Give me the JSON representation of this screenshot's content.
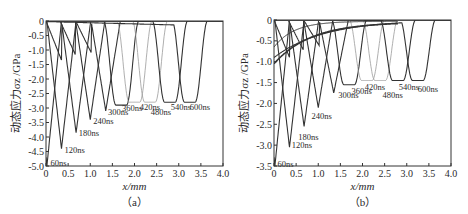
{
  "chart_data": [
    {
      "panel": "(a)",
      "type": "line",
      "caption": "（a）",
      "title": "",
      "xlabel": "x/mm",
      "ylabel": "动态应力σz /GPa",
      "xlim": [
        0,
        4.0
      ],
      "ylim": [
        -5.0,
        0
      ],
      "xticks": [
        "0",
        "0.5",
        "1.0",
        "1.5",
        "2.0",
        "2.5",
        "3.0",
        "3.5",
        "4.0"
      ],
      "yticks": [
        "0",
        "-0.5",
        "-1.0",
        "-1.5",
        "-2.0",
        "-2.5",
        "-3.0",
        "-3.5",
        "-4.0",
        "-4.5",
        "-5.0"
      ],
      "grid": false,
      "legend": "inline annotations",
      "series": [
        {
          "name": "60ns",
          "peak_x": 0.02,
          "peak_y": -5.0,
          "label_x": 0.1,
          "label_y": -4.9
        },
        {
          "name": "120ns",
          "peak_x": 0.35,
          "peak_y": -4.4,
          "label_x": 0.42,
          "label_y": -4.45
        },
        {
          "name": "180ns",
          "peak_x": 0.68,
          "peak_y": -3.85,
          "label_x": 0.74,
          "label_y": -3.85
        },
        {
          "name": "240ns",
          "peak_x": 1.0,
          "peak_y": -3.4,
          "label_x": 1.07,
          "label_y": -3.45
        },
        {
          "name": "300ns",
          "peak_x": 1.35,
          "peak_y": -3.1,
          "label_x": 1.4,
          "label_y": -3.15
        },
        {
          "name": "360ns",
          "peak_x": 1.7,
          "peak_y": -2.9,
          "label_x": 1.72,
          "label_y": -3.0
        },
        {
          "name": "420ns",
          "peak_x": 2.0,
          "peak_y": -2.8,
          "label_x": 2.12,
          "label_y": -2.95
        },
        {
          "name": "480ns",
          "peak_x": 2.35,
          "peak_y": -2.8,
          "label_x": 2.37,
          "label_y": -3.15
        },
        {
          "name": "540ns",
          "peak_x": 2.8,
          "peak_y": -2.8,
          "label_x": 2.82,
          "label_y": -2.95
        },
        {
          "name": "600ns",
          "peak_x": 3.25,
          "peak_y": -2.8,
          "label_x": 3.25,
          "label_y": -2.95
        }
      ]
    },
    {
      "panel": "(b)",
      "type": "line",
      "caption": "（b）",
      "title": "",
      "xlabel": "x/mm",
      "ylabel": "动态应力σz /GPa",
      "xlim": [
        0,
        4.0
      ],
      "ylim": [
        -3.5,
        0
      ],
      "xticks": [
        "0",
        "0.5",
        "1.0",
        "1.5",
        "2.0",
        "2.5",
        "3.0",
        "3.5",
        "4.0"
      ],
      "yticks": [
        "0",
        "-0.5",
        "-1.0",
        "-1.5",
        "-2.0",
        "-2.5",
        "-3.0",
        "-3.5"
      ],
      "grid": false,
      "legend": "inline annotations",
      "series": [
        {
          "name": "60ns",
          "peak_x": 0.02,
          "peak_y": -3.5,
          "label_x": 0.08,
          "label_y": -3.45
        },
        {
          "name": "120ns",
          "peak_x": 0.35,
          "peak_y": -3.05,
          "label_x": 0.4,
          "label_y": -3.0
        },
        {
          "name": "180ns",
          "peak_x": 0.68,
          "peak_y": -2.55,
          "label_x": 0.55,
          "label_y": -2.8
        },
        {
          "name": "240ns",
          "peak_x": 1.0,
          "peak_y": -2.1,
          "label_x": 0.85,
          "label_y": -2.3
        },
        {
          "name": "300ns",
          "peak_x": 1.35,
          "peak_y": -1.75,
          "label_x": 1.45,
          "label_y": -1.8
        },
        {
          "name": "360ns",
          "peak_x": 1.7,
          "peak_y": -1.55,
          "label_x": 1.75,
          "label_y": -1.7
        },
        {
          "name": "420ns",
          "peak_x": 2.1,
          "peak_y": -1.45,
          "label_x": 2.05,
          "label_y": -1.6
        },
        {
          "name": "480ns",
          "peak_x": 2.4,
          "peak_y": -1.45,
          "label_x": 2.45,
          "label_y": -1.8
        },
        {
          "name": "540ns",
          "peak_x": 2.8,
          "peak_y": -1.45,
          "label_x": 2.82,
          "label_y": -1.6
        },
        {
          "name": "600ns",
          "peak_x": 3.25,
          "peak_y": -1.45,
          "label_x": 3.25,
          "label_y": -1.65
        }
      ]
    }
  ]
}
